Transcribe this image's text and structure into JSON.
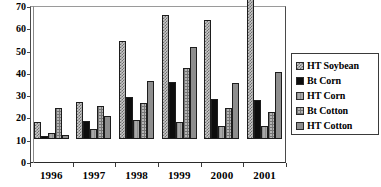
{
  "chart_data": {
    "type": "bar",
    "title": "",
    "subtitle": "",
    "xlabel": "",
    "ylabel": "",
    "categories": [
      "1996",
      "1997",
      "1998",
      "1999",
      "2000",
      "2001"
    ],
    "series": [
      {
        "name": "HT Soybean",
        "values": [
          7.5,
          16.5,
          44,
          55.5,
          53.5,
          68
        ],
        "color": "#c9c9c9",
        "pattern": "cross-hatch-diagonal"
      },
      {
        "name": "Bt Corn",
        "values": [
          1.5,
          8,
          19,
          25.5,
          18,
          17.5
        ],
        "color": "#0d0d0d",
        "pattern": "solid-black"
      },
      {
        "name": "HT Corn",
        "values": [
          2.5,
          4.5,
          8.5,
          7.5,
          6,
          6
        ],
        "color": "#a8a8a8",
        "pattern": "vertical-lines"
      },
      {
        "name": "Bt Cotton",
        "values": [
          14,
          15,
          16,
          32,
          14,
          12
        ],
        "color": "#b5b5b5",
        "pattern": "grid-lines"
      },
      {
        "name": "HT Cotton",
        "values": [
          2,
          10.5,
          26,
          41.5,
          25,
          30
        ],
        "color": "#8e8e8e",
        "pattern": "solid-gray"
      }
    ],
    "ylim": [
      0,
      70
    ],
    "yticks": [
      0,
      10,
      20,
      30,
      40,
      50,
      60,
      70
    ],
    "ytick_labels": [
      "0",
      "10",
      "20",
      "30",
      "40",
      "50",
      "60",
      "70"
    ],
    "grid": true,
    "grid_axis": "y",
    "legend_position": "right"
  },
  "legend": {
    "items": [
      {
        "label": "HT Soybean"
      },
      {
        "label": "Bt Corn"
      },
      {
        "label": "HT Corn"
      },
      {
        "label": "Bt Cotton"
      },
      {
        "label": "HT Cotton"
      }
    ]
  }
}
